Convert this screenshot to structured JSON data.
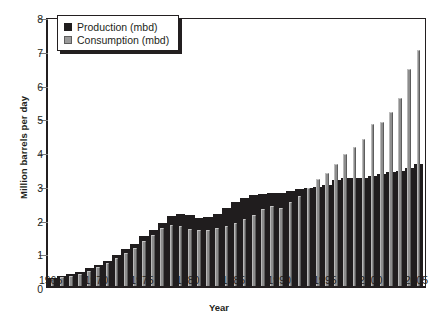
{
  "chart_data": {
    "type": "bar",
    "title": "",
    "xlabel": "Year",
    "ylabel": "Million barrels per day",
    "ylim": [
      0,
      8
    ],
    "ytick_step": 1,
    "yticks": [
      "0",
      "1",
      "2",
      "3",
      "4",
      "5",
      "6",
      "7",
      "8"
    ],
    "xlim": [
      1965,
      2006
    ],
    "xticks": [
      "1965",
      "1970",
      "1975",
      "1980",
      "1985",
      "1990",
      "1995",
      "2000",
      "2005"
    ],
    "grid": false,
    "legend_position": "top-left",
    "categories": [
      "1965",
      "1966",
      "1967",
      "1968",
      "1969",
      "1970",
      "1971",
      "1972",
      "1973",
      "1974",
      "1975",
      "1976",
      "1977",
      "1978",
      "1979",
      "1980",
      "1981",
      "1982",
      "1983",
      "1984",
      "1985",
      "1986",
      "1987",
      "1988",
      "1989",
      "1990",
      "1991",
      "1992",
      "1993",
      "1994",
      "1995",
      "1996",
      "1997",
      "1998",
      "1999",
      "2000",
      "2001",
      "2002",
      "2003",
      "2004",
      "2005"
    ],
    "series": [
      {
        "name": "Production (mbd)",
        "color": "#201d1e",
        "values": [
          0.23,
          0.29,
          0.35,
          0.42,
          0.52,
          0.62,
          0.75,
          0.92,
          1.09,
          1.25,
          1.49,
          1.67,
          1.87,
          2.08,
          2.12,
          2.11,
          2.01,
          2.04,
          2.12,
          2.3,
          2.5,
          2.62,
          2.69,
          2.73,
          2.76,
          2.77,
          2.83,
          2.88,
          2.89,
          2.93,
          2.99,
          3.13,
          3.21,
          3.21,
          3.21,
          3.25,
          3.31,
          3.39,
          3.41,
          3.49,
          3.63
        ]
      },
      {
        "name": "Consumption (mbd)",
        "color": "#8d8d8d",
        "values": [
          0.21,
          0.26,
          0.31,
          0.37,
          0.45,
          0.56,
          0.67,
          0.82,
          0.99,
          1.13,
          1.33,
          1.52,
          1.72,
          1.82,
          1.77,
          1.69,
          1.66,
          1.67,
          1.72,
          1.79,
          1.88,
          2.0,
          2.11,
          2.28,
          2.38,
          2.3,
          2.5,
          2.66,
          2.89,
          3.16,
          3.36,
          3.61,
          3.92,
          4.11,
          4.36,
          4.79,
          4.87,
          5.16,
          5.58,
          6.44,
          7.0
        ]
      }
    ]
  },
  "legend": {
    "items": [
      {
        "label": "Production (mbd)",
        "swatch": "prod"
      },
      {
        "label": "Consumption (mbd)",
        "swatch": "cons"
      }
    ]
  }
}
